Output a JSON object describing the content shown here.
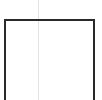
{
  "canvas": {
    "width": 102,
    "height": 100,
    "background": "#ffffff"
  },
  "shapes": [
    {
      "type": "open-rectangle",
      "color": "#2a2a2a",
      "stroke": 2
    },
    {
      "type": "vertical-guide-line",
      "color": "#e4e4e4"
    }
  ]
}
